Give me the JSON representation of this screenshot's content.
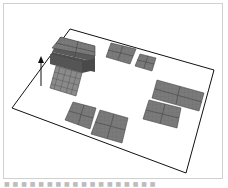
{
  "figure": {
    "caption": "■ ■ ■ ■ ■ ■ ■ ■ ■ ■ ■ ■  ■ ■ ■ ■ ■ ■",
    "colors": {
      "floor_outline": "#111111",
      "tile_fill": "#7a7a7a",
      "tile_line": "#4a4a4a",
      "block_top": "#6e6e6e",
      "block_side": "#555555",
      "arrow": "#111111"
    },
    "elements": [
      {
        "name": "stacked-block",
        "label": ""
      },
      {
        "name": "lattice-block",
        "label": ""
      },
      {
        "name": "tile-top-middle",
        "label": ""
      },
      {
        "name": "tile-top-small",
        "label": ""
      },
      {
        "name": "tile-right-wide",
        "label": ""
      },
      {
        "name": "tile-right-lower",
        "label": ""
      },
      {
        "name": "tile-bottom-left",
        "label": ""
      },
      {
        "name": "tile-bottom-center",
        "label": ""
      },
      {
        "name": "up-arrow",
        "label": ""
      }
    ]
  }
}
